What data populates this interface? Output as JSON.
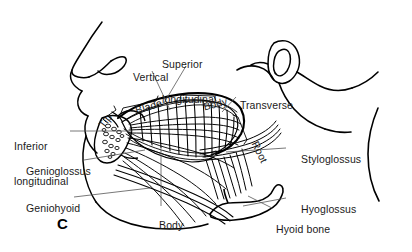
{
  "figure": {
    "panel_letter": "C",
    "caption_text": "",
    "background_color": "#ffffff",
    "ink_color": "#000000",
    "leader_line_color": "#555555"
  },
  "labels": [
    {
      "id": "vertical",
      "text": "Vertical",
      "line2": "",
      "x": 121,
      "y": 66,
      "rotation": 0,
      "align": "left",
      "icon": "text-label"
    },
    {
      "id": "superior-longitudinal",
      "text": "Superior",
      "line2": "longitudinal",
      "x": 162,
      "y": 42,
      "rotation": 0,
      "align": "left",
      "icon": "text-label"
    },
    {
      "id": "blade",
      "text": "Blade",
      "line2": "",
      "x": 129,
      "y": 96,
      "rotation": -17,
      "align": "left",
      "icon": "text-label"
    },
    {
      "id": "tip",
      "text": "Tip",
      "line2": "",
      "x": 108,
      "y": 112,
      "rotation": -52,
      "align": "left",
      "icon": "text-label"
    },
    {
      "id": "body-top",
      "text": "Body",
      "line2": "",
      "x": 196,
      "y": 95,
      "rotation": -14,
      "align": "left",
      "icon": "text-label"
    },
    {
      "id": "transverse",
      "text": "Transverse",
      "line2": "",
      "x": 228,
      "y": 92,
      "rotation": 0,
      "align": "left",
      "icon": "text-label"
    },
    {
      "id": "root",
      "text": "Root",
      "line2": "",
      "x": 239,
      "y": 104,
      "rotation": 64,
      "align": "left",
      "icon": "text-label"
    },
    {
      "id": "inferior-longitudinal",
      "text": "Inferior",
      "line2": "longitudinal",
      "x": 14,
      "y": 118,
      "rotation": 0,
      "align": "left",
      "icon": "text-label"
    },
    {
      "id": "genioglossus",
      "text": "Genioglossus",
      "line2": "",
      "x": 14,
      "y": 156,
      "rotation": 0,
      "align": "left",
      "icon": "text-label"
    },
    {
      "id": "geniohyoid",
      "text": "Geniohyoid",
      "line2": "",
      "x": 14,
      "y": 193,
      "rotation": 0,
      "align": "left",
      "icon": "text-label"
    },
    {
      "id": "styloglossus",
      "text": "Styloglossus",
      "line2": "",
      "x": 288,
      "y": 144,
      "rotation": 0,
      "align": "left",
      "icon": "text-label"
    },
    {
      "id": "hyoglossus",
      "text": "Hyoglossus",
      "line2": "",
      "x": 288,
      "y": 194,
      "rotation": 0,
      "align": "left",
      "icon": "text-label"
    },
    {
      "id": "hyoid-bone",
      "text": "Hyoid bone",
      "line2": "",
      "x": 264,
      "y": 213,
      "rotation": 0,
      "align": "left",
      "icon": "text-label"
    },
    {
      "id": "body-bottom",
      "text": "Body",
      "line2": "",
      "x": 148,
      "y": 210,
      "rotation": 0,
      "align": "left",
      "icon": "text-label"
    }
  ],
  "structures": [
    {
      "id": "facial-profile",
      "name": "facial-profile-outline"
    },
    {
      "id": "tongue-dorsum",
      "name": "tongue-dorsum-outline"
    },
    {
      "id": "vertical-fibers",
      "name": "vertical-muscle-fibers"
    },
    {
      "id": "mandible",
      "name": "mandible-cross-section"
    },
    {
      "id": "genioglossus-fan",
      "name": "genioglossus-fan-fibers"
    },
    {
      "id": "hyoid-bone-shape",
      "name": "hyoid-bone-outline"
    },
    {
      "id": "ear",
      "name": "ear-outline"
    },
    {
      "id": "neck",
      "name": "neck-contour"
    }
  ]
}
